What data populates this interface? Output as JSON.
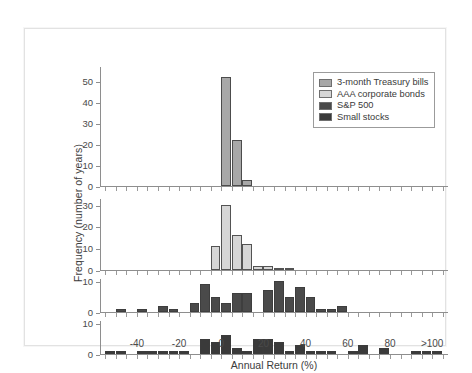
{
  "figure": {
    "ylabel": "Frequency (number of years)",
    "xlabel": "Annual Return (%)"
  },
  "legend": {
    "items": [
      {
        "label": "3-month Treasury bills",
        "color": "#a8a8a8"
      },
      {
        "label": "AAA corporate bonds",
        "color": "#d6d6d6"
      },
      {
        "label": "S&P 500",
        "color": "#4a4a4a"
      },
      {
        "label": "Small stocks",
        "color": "#3a3a3a"
      }
    ]
  },
  "xaxis": {
    "tick_labels": [
      "-40",
      "-20",
      "0",
      "20",
      "40",
      "60",
      "80",
      ">100"
    ],
    "tick_values": [
      -40,
      -20,
      0,
      20,
      40,
      60,
      80,
      100
    ],
    "min": -57.5,
    "max": 107.5,
    "minor_step": 5
  },
  "chart_data": {
    "type": "bar",
    "title": "",
    "xlabel": "Annual Return (%)",
    "ylabel": "Frequency (number of years)",
    "grid": false,
    "legend_position": "top-right",
    "bin_width": 5,
    "bin_starts": [
      -55,
      -50,
      -45,
      -40,
      -35,
      -30,
      -25,
      -20,
      -15,
      -10,
      -5,
      0,
      5,
      10,
      15,
      20,
      25,
      30,
      35,
      40,
      45,
      50,
      55,
      60,
      65,
      70,
      75,
      80,
      85,
      90,
      95,
      100
    ],
    "panels": [
      {
        "name": "3-month Treasury bills",
        "color": "#a8a8a8",
        "ylim": [
          0,
          57
        ],
        "yticks": [
          0,
          10,
          20,
          30,
          40,
          50
        ],
        "values": [
          0,
          0,
          0,
          0,
          0,
          0,
          0,
          0,
          0,
          0,
          0,
          52,
          22,
          3,
          0,
          0,
          0,
          0,
          0,
          0,
          0,
          0,
          0,
          0,
          0,
          0,
          0,
          0,
          0,
          0,
          0,
          0
        ]
      },
      {
        "name": "AAA corporate bonds",
        "color": "#d6d6d6",
        "ylim": [
          0,
          33
        ],
        "yticks": [
          0,
          10,
          20,
          30
        ],
        "values": [
          0,
          0,
          0,
          0,
          0,
          0,
          0,
          0,
          0,
          0,
          11,
          30,
          16,
          12,
          2,
          2,
          1,
          1,
          0,
          0,
          0,
          0,
          0,
          0,
          0,
          0,
          0,
          0,
          0,
          0,
          0,
          0
        ]
      },
      {
        "name": "S&P 500",
        "color": "#4a4a4a",
        "ylim": [
          0,
          11
        ],
        "yticks": [
          0,
          10
        ],
        "values": [
          0,
          1,
          0,
          1,
          0,
          2,
          1,
          0,
          3,
          9,
          5,
          3,
          6,
          6,
          0,
          7,
          10,
          5,
          8,
          5,
          1,
          1,
          2,
          0,
          0,
          0,
          0,
          0,
          0,
          0,
          0,
          0
        ]
      },
      {
        "name": "Small stocks",
        "color": "#3a3a3a",
        "ylim": [
          0,
          11
        ],
        "yticks": [
          0,
          10
        ],
        "values": [
          1,
          1,
          0,
          1,
          1,
          1,
          1,
          1,
          0,
          5,
          4,
          6,
          2,
          1,
          5,
          5,
          4,
          1,
          3,
          1,
          1,
          1,
          0,
          1,
          3,
          0,
          2,
          0,
          0,
          1,
          1,
          1
        ]
      }
    ]
  }
}
